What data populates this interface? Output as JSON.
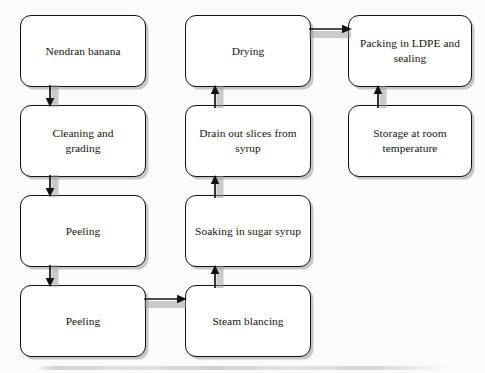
{
  "diagram": {
    "type": "flowchart",
    "background_color": "#fbfbf9",
    "box_border_color": "#14110f",
    "box_fill_color": "#ffffff",
    "shadow_color": "#787878",
    "arrow_color": "#14110f",
    "nodes": [
      {
        "id": "nendran-banana",
        "label": "Nendran banana",
        "column": 1,
        "row": 1
      },
      {
        "id": "cleaning-grading",
        "label": "Cleaning and\ngrading",
        "column": 1,
        "row": 2
      },
      {
        "id": "peeling-1",
        "label": "Peeling",
        "column": 1,
        "row": 3
      },
      {
        "id": "peeling-2",
        "label": "Peeling",
        "column": 1,
        "row": 4
      },
      {
        "id": "steam-blancing",
        "label": "Steam blancing",
        "column": 2,
        "row": 4
      },
      {
        "id": "soaking-sugar-syrup",
        "label": "Soaking in sugar syrup",
        "column": 2,
        "row": 3
      },
      {
        "id": "drain-out-slices",
        "label": "Drain out slices from\nsyrup",
        "column": 2,
        "row": 2
      },
      {
        "id": "drying",
        "label": "Drying",
        "column": 2,
        "row": 1
      },
      {
        "id": "packing-ldpe",
        "label": "Packing in LDPE and\nsealing",
        "column": 3,
        "row": 1
      },
      {
        "id": "storage-room-temp",
        "label": "Storage at room\ntemperature",
        "column": 3,
        "row": 2
      }
    ],
    "edges": [
      {
        "id": "edge-banana-to-cleaning",
        "from": "nendran-banana",
        "to": "cleaning-grading",
        "direction": "down"
      },
      {
        "id": "edge-cleaning-to-peeling1",
        "from": "cleaning-grading",
        "to": "peeling-1",
        "direction": "down"
      },
      {
        "id": "edge-peeling1-to-peeling2",
        "from": "peeling-1",
        "to": "peeling-2",
        "direction": "down"
      },
      {
        "id": "edge-peeling2-to-steam",
        "from": "peeling-2",
        "to": "steam-blancing",
        "direction": "right"
      },
      {
        "id": "edge-steam-to-soaking",
        "from": "steam-blancing",
        "to": "soaking-sugar-syrup",
        "direction": "up"
      },
      {
        "id": "edge-soaking-to-drain",
        "from": "soaking-sugar-syrup",
        "to": "drain-out-slices",
        "direction": "up"
      },
      {
        "id": "edge-drain-to-drying",
        "from": "drain-out-slices",
        "to": "drying",
        "direction": "up"
      },
      {
        "id": "edge-drying-to-packing",
        "from": "drying",
        "to": "packing-ldpe",
        "direction": "right"
      },
      {
        "id": "edge-storage-to-packing",
        "from": "storage-room-temp",
        "to": "packing-ldpe",
        "direction": "up"
      }
    ]
  }
}
